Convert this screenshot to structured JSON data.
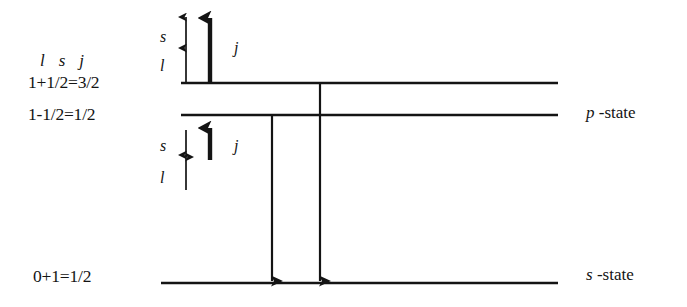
{
  "figure": {
    "background_color": "#ffffff",
    "ink_color": "#141414"
  },
  "quantum_header": {
    "orbital": "l",
    "spin": "s",
    "total": "j"
  },
  "levels": [
    {
      "id": "p-three-halves",
      "equation": "1+1/2=3/2",
      "label_x": 28,
      "label_y": 83,
      "line_x1": 181,
      "line_x2": 558,
      "line_y": 83
    },
    {
      "id": "p-one-half",
      "equation": "1-1/2=1/2",
      "label_x": 28,
      "label_y": 115,
      "line_x1": 181,
      "line_x2": 558,
      "line_y": 115
    },
    {
      "id": "s-one-half",
      "equation": "0+1=1/2",
      "label_x": 33,
      "label_y": 277,
      "line_x1": 161,
      "line_x2": 558,
      "line_y": 283
    }
  ],
  "state_labels": [
    {
      "id": "p-state",
      "symbol": "p",
      "suffix": "-state",
      "x": 586,
      "y": 113
    },
    {
      "id": "s-state",
      "symbol": "s",
      "suffix": "-state",
      "x": 586,
      "y": 275
    }
  ],
  "vector_groups": [
    {
      "id": "parallel-coupling",
      "description": "l up, s up, j up (j = 3/2)",
      "orbital": {
        "label": "l",
        "direction": "up",
        "label_x": 160,
        "label_y": 66,
        "arrow_x": 186,
        "arrow_top": 48,
        "arrow_bottom": 82
      },
      "spin": {
        "label": "s",
        "direction": "up",
        "label_x": 160,
        "label_y": 37,
        "arrow_x": 186,
        "arrow_top": 17,
        "arrow_bottom": 48
      },
      "total": {
        "label": "j",
        "direction": "up",
        "label_x": 234,
        "label_y": 48,
        "arrow_x": 210,
        "arrow_top": 18,
        "arrow_bottom": 82
      }
    },
    {
      "id": "antiparallel-coupling",
      "description": "l up, s down, j up (j = 1/2)",
      "orbital": {
        "label": "l",
        "direction": "up",
        "label_x": 160,
        "label_y": 178,
        "arrow_x": 186,
        "arrow_top": 155,
        "arrow_bottom": 190
      },
      "spin": {
        "label": "s",
        "direction": "down",
        "label_x": 160,
        "label_y": 146,
        "arrow_x": 186,
        "arrow_top": 130,
        "arrow_bottom": 157
      },
      "total": {
        "label": "j",
        "direction": "up",
        "label_x": 234,
        "label_y": 146,
        "arrow_x": 210,
        "arrow_top": 128,
        "arrow_bottom": 160
      }
    }
  ],
  "transitions": [
    {
      "id": "transition-from-one-half",
      "x": 272,
      "y_start": 115,
      "y_end": 281,
      "direction": "down"
    },
    {
      "id": "transition-from-three-halves",
      "x": 320,
      "y_start": 83,
      "y_end": 281,
      "direction": "down"
    }
  ]
}
